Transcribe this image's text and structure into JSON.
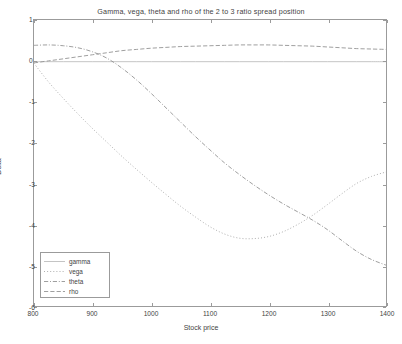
{
  "figure": {
    "background": "#ffffff",
    "frame_color": "#9b9b9b",
    "text_color": "#3f3f3f"
  },
  "chart_data": {
    "type": "line",
    "title": "Gamma, vega, theta and rho of the 2 to 3 ratio spread position",
    "xlabel": "Stock price",
    "ylabel": "Delta",
    "xlim": [
      800,
      1400
    ],
    "ylim": [
      -6,
      1
    ],
    "xticks": [
      800,
      900,
      1000,
      1100,
      1200,
      1300,
      1400
    ],
    "yticks": [
      1,
      0,
      -1,
      -2,
      -3,
      -4,
      -5,
      -6
    ],
    "xtick_labels": [
      "800",
      "900",
      "1000",
      "1100",
      "1200",
      "1300",
      "1400"
    ],
    "ytick_labels": [
      "1",
      "0",
      "-1",
      "-2",
      "-3",
      "-4",
      "-5",
      "-6"
    ],
    "grid": false,
    "legend_position": "lower left",
    "x": [
      800,
      825,
      850,
      875,
      900,
      925,
      950,
      975,
      1000,
      1025,
      1050,
      1075,
      1100,
      1125,
      1150,
      1175,
      1200,
      1225,
      1250,
      1275,
      1300,
      1325,
      1350,
      1375,
      1400
    ],
    "series": [
      {
        "name": "gamma",
        "color": "#b9b9b9",
        "linestyle": "solid",
        "values": [
          -0.02,
          -0.02,
          -0.02,
          -0.02,
          -0.02,
          -0.02,
          -0.02,
          -0.02,
          -0.02,
          -0.02,
          -0.02,
          -0.02,
          -0.02,
          -0.02,
          -0.02,
          -0.02,
          -0.02,
          -0.02,
          -0.02,
          -0.02,
          -0.02,
          -0.02,
          -0.02,
          -0.02,
          -0.02
        ]
      },
      {
        "name": "vega",
        "color": "#a0a0a0",
        "linestyle": "dotted",
        "values": [
          -0.06,
          -0.52,
          -0.92,
          -1.3,
          -1.66,
          -2.0,
          -2.34,
          -2.66,
          -2.97,
          -3.27,
          -3.56,
          -3.82,
          -4.06,
          -4.24,
          -4.34,
          -4.35,
          -4.3,
          -4.18,
          -4.0,
          -3.78,
          -3.52,
          -3.25,
          -3.0,
          -2.83,
          -2.72
        ]
      },
      {
        "name": "theta",
        "color": "#8e8e8e",
        "linestyle": "dashdot",
        "values": [
          0.38,
          0.39,
          0.37,
          0.32,
          0.22,
          0.06,
          -0.18,
          -0.47,
          -0.8,
          -1.15,
          -1.5,
          -1.85,
          -2.18,
          -2.5,
          -2.78,
          -3.04,
          -3.28,
          -3.5,
          -3.7,
          -3.9,
          -4.13,
          -4.4,
          -4.66,
          -4.86,
          -5.0
        ]
      },
      {
        "name": "rho",
        "color": "#8e8e8e",
        "linestyle": "dashed",
        "values": [
          -0.05,
          0.0,
          0.05,
          0.1,
          0.15,
          0.2,
          0.25,
          0.28,
          0.31,
          0.33,
          0.35,
          0.36,
          0.37,
          0.38,
          0.39,
          0.39,
          0.39,
          0.38,
          0.37,
          0.36,
          0.34,
          0.32,
          0.3,
          0.29,
          0.28
        ]
      }
    ]
  },
  "legend": {
    "items": [
      {
        "label": "gamma"
      },
      {
        "label": "vega"
      },
      {
        "label": "theta"
      },
      {
        "label": "rho"
      }
    ]
  }
}
